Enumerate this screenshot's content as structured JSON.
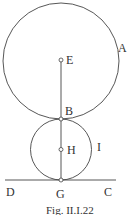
{
  "figure": {
    "caption": "Fig. II.I.22",
    "colors": {
      "stroke": "#444444",
      "text": "#333333",
      "background": "#ffffff"
    },
    "labels": {
      "A": "A",
      "E": "E",
      "B": "B",
      "H": "H",
      "I": "I",
      "D": "D",
      "G": "G",
      "C": "C"
    },
    "elements": {
      "large_circle": "A",
      "small_circle": "I",
      "tangent_line": "DC",
      "vertical_segment": "EG",
      "points": [
        "E",
        "B",
        "H",
        "G"
      ]
    }
  }
}
